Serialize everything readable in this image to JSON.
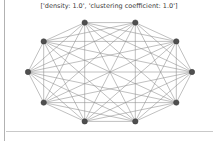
{
  "figure": {
    "title": "['density: 1.0', 'clustering coefficient: 1.0']",
    "background": "#ffffff",
    "panel_border_left_color": "#b2b2b2",
    "canvas_bottom_edge_color": "#c9c9c9"
  },
  "metrics": {
    "density": "1.0",
    "clustering_coefficient": "1.0"
  },
  "chart_data": {
    "type": "network-graph",
    "layout": "circular",
    "complete_graph": true,
    "node_count": 10,
    "edge_count": 45,
    "title": "['density: 1.0', 'clustering coefficient: 1.0']",
    "node_color": "#4f4f4f",
    "node_stroke_color": "#383838",
    "node_radius": 2.7,
    "edge_color": "#8c8c8c",
    "edge_width": 0.55,
    "ellipse": {
      "cx": 110,
      "cy": 72,
      "rx": 82,
      "ry": 52
    },
    "nodes": [
      {
        "id": 0,
        "x": 192.0,
        "y": 72.0
      },
      {
        "id": 1,
        "x": 176.3,
        "y": 102.6
      },
      {
        "id": 2,
        "x": 135.3,
        "y": 121.4
      },
      {
        "id": 3,
        "x": 84.7,
        "y": 121.4
      },
      {
        "id": 4,
        "x": 43.7,
        "y": 102.6
      },
      {
        "id": 5,
        "x": 28.0,
        "y": 72.0
      },
      {
        "id": 6,
        "x": 43.7,
        "y": 41.4
      },
      {
        "id": 7,
        "x": 84.7,
        "y": 22.6
      },
      {
        "id": 8,
        "x": 135.3,
        "y": 22.6
      },
      {
        "id": 9,
        "x": 176.3,
        "y": 41.4
      }
    ],
    "edges": [
      [
        0,
        1
      ],
      [
        0,
        2
      ],
      [
        0,
        3
      ],
      [
        0,
        4
      ],
      [
        0,
        5
      ],
      [
        0,
        6
      ],
      [
        0,
        7
      ],
      [
        0,
        8
      ],
      [
        0,
        9
      ],
      [
        1,
        2
      ],
      [
        1,
        3
      ],
      [
        1,
        4
      ],
      [
        1,
        5
      ],
      [
        1,
        6
      ],
      [
        1,
        7
      ],
      [
        1,
        8
      ],
      [
        1,
        9
      ],
      [
        2,
        3
      ],
      [
        2,
        4
      ],
      [
        2,
        5
      ],
      [
        2,
        6
      ],
      [
        2,
        7
      ],
      [
        2,
        8
      ],
      [
        2,
        9
      ],
      [
        3,
        4
      ],
      [
        3,
        5
      ],
      [
        3,
        6
      ],
      [
        3,
        7
      ],
      [
        3,
        8
      ],
      [
        3,
        9
      ],
      [
        4,
        5
      ],
      [
        4,
        6
      ],
      [
        4,
        7
      ],
      [
        4,
        8
      ],
      [
        4,
        9
      ],
      [
        5,
        6
      ],
      [
        5,
        7
      ],
      [
        5,
        8
      ],
      [
        5,
        9
      ],
      [
        6,
        7
      ],
      [
        6,
        8
      ],
      [
        6,
        9
      ],
      [
        7,
        8
      ],
      [
        7,
        9
      ],
      [
        8,
        9
      ]
    ]
  }
}
